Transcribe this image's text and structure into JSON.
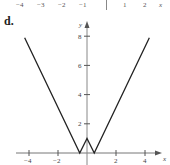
{
  "panel_label": "d.",
  "previous_axis": {
    "labels": [
      "−4",
      "−3",
      "−2",
      "−1",
      "1",
      "2",
      "x"
    ]
  },
  "chart_data": {
    "type": "line",
    "title": "",
    "xlabel": "x",
    "ylabel": "y",
    "xlim": [
      -4.8,
      5.2
    ],
    "ylim": [
      0,
      9
    ],
    "x_ticks": [
      -4,
      -2,
      2,
      4
    ],
    "x_tick_labels": [
      "−4",
      "−2",
      "2",
      "4"
    ],
    "y_ticks": [
      2,
      4,
      6,
      8
    ],
    "y_tick_labels": [
      "2",
      "4",
      "6",
      "8"
    ],
    "grid": false,
    "legend": null,
    "series": [
      {
        "name": "y = |2|x| − 1|",
        "x": [
          -4.3,
          -0.5,
          0,
          0.5,
          4.3
        ],
        "y": [
          7.9,
          0,
          1,
          0,
          7.9
        ]
      }
    ],
    "colors": {
      "line": "#222222",
      "axis": "#777777"
    }
  }
}
